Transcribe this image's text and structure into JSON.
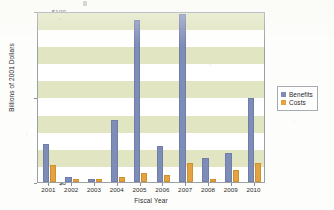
{
  "chart_data": {
    "type": "bar",
    "title": "",
    "xlabel": "Fiscal Year",
    "ylabel": "Billions of 2001 Dollars",
    "categories": [
      "2001",
      "2002",
      "2003",
      "2004",
      "2005",
      "2006",
      "2007",
      "2008",
      "2009",
      "2010"
    ],
    "series": [
      {
        "name": "Benefits",
        "color": "#7e8cb8",
        "values": [
          22,
          3,
          2,
          36,
          95,
          21,
          98,
          14,
          17,
          49
        ]
      },
      {
        "name": "Costs",
        "color": "#e3a340",
        "values": [
          10,
          1.5,
          1.5,
          3,
          5,
          4,
          11,
          1.5,
          7,
          11
        ]
      }
    ],
    "ylim": [
      0,
      100
    ],
    "yticks": [
      0,
      50,
      100
    ],
    "ytick_labels": [
      "$0",
      "$50",
      "$100"
    ],
    "grid": "horizontal-bands",
    "band_color": "#dde0b6",
    "legend_position": "right"
  },
  "legend": {
    "items": [
      {
        "label": "Benefits"
      },
      {
        "label": "Costs"
      }
    ]
  },
  "axes": {
    "y_label": "Billions of 2001 Dollars",
    "x_label": "Fiscal Year",
    "y_tick_top": "$100",
    "y_tick_mid": "$50",
    "y_tick_bottom": "$0"
  }
}
